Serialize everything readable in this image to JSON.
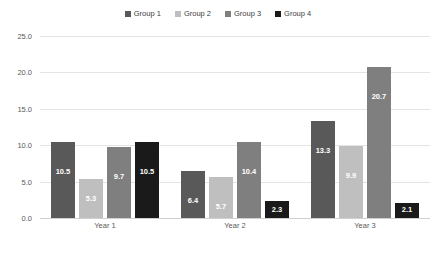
{
  "chart_data": {
    "type": "bar",
    "title": "",
    "xlabel": "",
    "ylabel": "",
    "categories": [
      "Year 1",
      "Year 2",
      "Year 3"
    ],
    "series": [
      {
        "name": "Group 1",
        "color": "#595959",
        "values": [
          10.5,
          6.4,
          13.3
        ]
      },
      {
        "name": "Group 2",
        "color": "#bfbfbf",
        "values": [
          5.3,
          5.7,
          9.9
        ]
      },
      {
        "name": "Group 3",
        "color": "#7f7f7f",
        "values": [
          9.7,
          10.4,
          20.7
        ]
      },
      {
        "name": "Group 4",
        "color": "#1a1a1a",
        "values": [
          10.5,
          2.3,
          2.1
        ]
      }
    ],
    "ylim": [
      0,
      25
    ],
    "ytick_step": 5,
    "ytick_labels": [
      "0.0",
      "5.0",
      "10.0",
      "15.0",
      "20.0",
      "25.0"
    ],
    "grid": true,
    "legend_position": "top",
    "data_labels": true,
    "data_label_color": "#ffffff"
  }
}
